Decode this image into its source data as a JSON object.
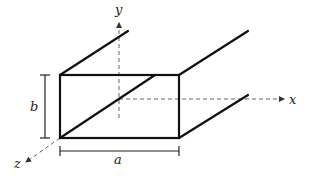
{
  "figure": {
    "axes": {
      "x_label": "x",
      "y_label": "y",
      "z_label": "z"
    },
    "dimensions": {
      "width_label": "a",
      "height_label": "b"
    },
    "colors": {
      "edge": "#111111",
      "axis": "#555555",
      "background": "#ffffff"
    }
  }
}
